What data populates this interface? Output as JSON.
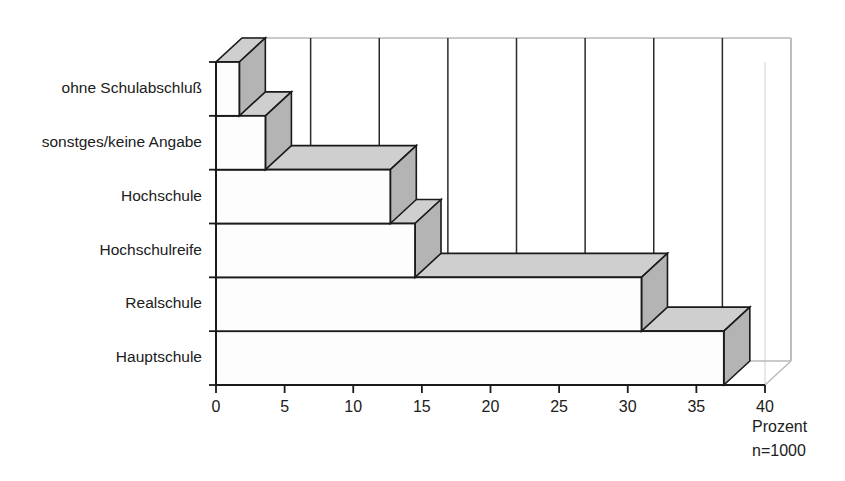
{
  "chart_data": {
    "type": "bar",
    "orientation": "horizontal",
    "style": "3d",
    "title": "",
    "subtitle": "",
    "xlabel": "Prozent",
    "ylabel": "",
    "categories": [
      "ohne Schulabschluß",
      "sonstges/keine Angabe",
      "Hochschule",
      "Hochschulreife",
      "Realschule",
      "Hauptschule"
    ],
    "values": [
      1.7,
      3.6,
      12.7,
      14.5,
      31.0,
      37.0
    ],
    "xlim": [
      0,
      40
    ],
    "xticks": [
      0,
      5,
      10,
      15,
      20,
      25,
      30,
      35,
      40
    ],
    "xtick_labels": [
      "0",
      "5",
      "10",
      "15",
      "20",
      "25",
      "30",
      "35",
      "40"
    ],
    "grid": "vertical",
    "legend": "none",
    "annotations": [
      "Prozent",
      "n=1000"
    ],
    "sample_size_label": "n=1000",
    "unit_label": "Prozent"
  },
  "colors": {
    "bar_front": "#fdfdfd",
    "bar_top": "#cfcfcf",
    "bar_side": "#b4b4b4",
    "outline": "#1a1a1a",
    "back_wall_edge": "#b9b9b9",
    "grid_line": "#2a2a2a",
    "text": "#202020",
    "background": "#ffffff"
  },
  "axis": {
    "x_axis_label": "Prozent",
    "n_label": "n=1000"
  }
}
